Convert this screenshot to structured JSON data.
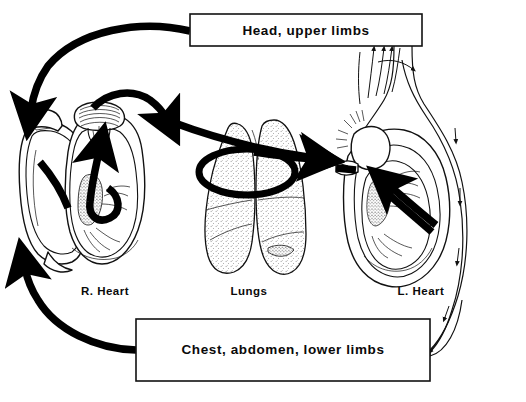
{
  "figure": {
    "background_color": "#ffffff",
    "ink_color": "#111111",
    "width": 526,
    "height": 402
  },
  "boxes": [
    {
      "id": "head-upper-limbs",
      "label": "Head, upper limbs",
      "x": 190,
      "y": 14,
      "width": 232,
      "height": 32
    },
    {
      "id": "chest-abdomen-lower-limbs",
      "label": "Chest, abdomen, lower limbs",
      "x": 136,
      "y": 319,
      "width": 294,
      "height": 62
    }
  ],
  "organs": [
    {
      "id": "right-heart",
      "label": "R. Heart",
      "label_x": 105,
      "label_y": 292
    },
    {
      "id": "lungs",
      "label": "Lungs",
      "label_x": 249,
      "label_y": 292
    },
    {
      "id": "left-heart",
      "label": "L. Heart",
      "label_x": 421,
      "label_y": 292
    }
  ],
  "flows": [
    {
      "id": "head-to-right-heart",
      "from": "head-upper-limbs",
      "to": "right-heart",
      "style": "thick-curved-arrow",
      "description": "Venous return from head and upper limbs into the right heart"
    },
    {
      "id": "lower-body-to-right-heart",
      "from": "chest-abdomen-lower-limbs",
      "to": "right-heart",
      "style": "thick-curved-arrow",
      "description": "Venous return from chest, abdomen and lower limbs into the right heart"
    },
    {
      "id": "right-heart-to-lungs",
      "from": "right-heart",
      "to": "lungs",
      "style": "thick-curved-arrow",
      "description": "Pulmonary artery carrying blood from right heart to lungs"
    },
    {
      "id": "lungs-to-left-heart",
      "from": "lungs",
      "to": "left-heart",
      "style": "thick-straight-arrow",
      "description": "Pulmonary vein carrying blood from lungs to left heart"
    },
    {
      "id": "left-heart-to-aorta",
      "from": "left-heart",
      "to": "aorta",
      "style": "thick-straight-arrow",
      "description": "Left ventricle ejecting blood into the aorta"
    },
    {
      "id": "aorta-to-head",
      "from": "aorta",
      "to": "head-upper-limbs",
      "style": "thin-vessel-arrows",
      "description": "Aortic arch branches supplying head and upper limbs"
    },
    {
      "id": "aorta-to-lower-body",
      "from": "aorta",
      "to": "chest-abdomen-lower-limbs",
      "style": "thin-vessel-arrows",
      "description": "Descending aorta supplying chest, abdomen and lower limbs"
    }
  ],
  "caption": {
    "text": ""
  }
}
